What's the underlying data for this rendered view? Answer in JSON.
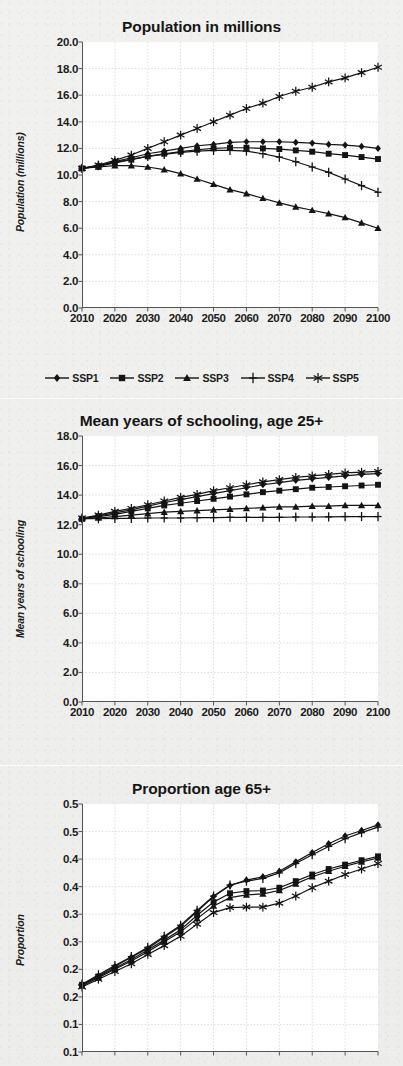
{
  "page": {
    "background_color": "#efefed",
    "plot_background_color": "#ffffff",
    "ink_color": "#141414",
    "gridline_color": "#cfcfcf"
  },
  "legend": {
    "position": "below-first-chart",
    "items": [
      {
        "label": "SSP1",
        "marker": "diamond-marker-icon"
      },
      {
        "label": "SSP2",
        "marker": "square-marker-icon"
      },
      {
        "label": "SSP3",
        "marker": "triangle-marker-icon"
      },
      {
        "label": "SSP4",
        "marker": "plus-marker-icon"
      },
      {
        "label": "SSP5",
        "marker": "asterisk-marker-icon"
      }
    ]
  },
  "chart_data": [
    {
      "id": "population",
      "type": "line",
      "title": "Population in millions",
      "xlabel": "",
      "ylabel": "Population (millions)",
      "x": [
        2010,
        2015,
        2020,
        2025,
        2030,
        2035,
        2040,
        2045,
        2050,
        2055,
        2060,
        2065,
        2070,
        2075,
        2080,
        2085,
        2090,
        2095,
        2100
      ],
      "xticks": [
        2010,
        2020,
        2030,
        2040,
        2050,
        2060,
        2070,
        2080,
        2090,
        2100
      ],
      "xtick_labels": [
        "2010",
        "2020",
        "2030",
        "2040",
        "2050",
        "2060",
        "2070",
        "2080",
        "2090",
        "2100"
      ],
      "xlim": [
        2010,
        2100
      ],
      "ylim": [
        0.0,
        20.0
      ],
      "yticks": [
        0.0,
        2.0,
        4.0,
        6.0,
        8.0,
        10.0,
        12.0,
        14.0,
        16.0,
        18.0,
        20.0
      ],
      "ytick_labels": [
        "0.0",
        "2.0",
        "4.0",
        "6.0",
        "8.0",
        "10.0",
        "12.0",
        "14.0",
        "16.0",
        "18.0",
        "20.0"
      ],
      "grid": true,
      "series": [
        {
          "name": "SSP1",
          "marker": "diamond-marker-icon",
          "values": [
            10.5,
            10.7,
            11.0,
            11.3,
            11.6,
            11.8,
            12.0,
            12.2,
            12.3,
            12.45,
            12.5,
            12.5,
            12.5,
            12.45,
            12.4,
            12.3,
            12.25,
            12.15,
            12.0
          ]
        },
        {
          "name": "SSP2",
          "marker": "square-marker-icon",
          "values": [
            10.5,
            10.65,
            10.9,
            11.15,
            11.4,
            11.6,
            11.75,
            11.9,
            12.0,
            12.05,
            12.05,
            12.0,
            11.95,
            11.85,
            11.75,
            11.6,
            11.5,
            11.35,
            11.2
          ]
        },
        {
          "name": "SSP3",
          "marker": "triangle-marker-icon",
          "values": [
            10.5,
            10.6,
            10.7,
            10.7,
            10.6,
            10.4,
            10.1,
            9.7,
            9.3,
            8.9,
            8.6,
            8.25,
            7.9,
            7.6,
            7.35,
            7.1,
            6.8,
            6.4,
            6.0
          ]
        },
        {
          "name": "SSP4",
          "marker": "plus-marker-icon",
          "values": [
            10.5,
            10.7,
            10.95,
            11.2,
            11.4,
            11.55,
            11.7,
            11.8,
            11.85,
            11.85,
            11.8,
            11.6,
            11.35,
            11.0,
            10.6,
            10.2,
            9.7,
            9.2,
            8.7
          ]
        },
        {
          "name": "SSP5",
          "marker": "asterisk-marker-icon",
          "values": [
            10.5,
            10.75,
            11.1,
            11.5,
            12.0,
            12.5,
            13.0,
            13.5,
            14.0,
            14.5,
            15.0,
            15.4,
            15.9,
            16.3,
            16.6,
            17.0,
            17.3,
            17.7,
            18.1
          ]
        }
      ]
    },
    {
      "id": "schooling",
      "type": "line",
      "title": "Mean years of schooling, age 25+",
      "xlabel": "",
      "ylabel": "Mean years of schooling",
      "x": [
        2010,
        2015,
        2020,
        2025,
        2030,
        2035,
        2040,
        2045,
        2050,
        2055,
        2060,
        2065,
        2070,
        2075,
        2080,
        2085,
        2090,
        2095,
        2100
      ],
      "xticks": [
        2010,
        2020,
        2030,
        2040,
        2050,
        2060,
        2070,
        2080,
        2090,
        2100
      ],
      "xtick_labels": [
        "2010",
        "2020",
        "2030",
        "2040",
        "2050",
        "2060",
        "2070",
        "2080",
        "2090",
        "2100"
      ],
      "xlim": [
        2010,
        2100
      ],
      "ylim": [
        0.0,
        18.0
      ],
      "yticks": [
        0.0,
        2.0,
        4.0,
        6.0,
        8.0,
        10.0,
        12.0,
        14.0,
        16.0,
        18.0
      ],
      "ytick_labels": [
        "0.0",
        "2.0",
        "4.0",
        "6.0",
        "8.0",
        "10.0",
        "12.0",
        "14.0",
        "16.0",
        "18.0"
      ],
      "grid": true,
      "series": [
        {
          "name": "SSP1",
          "marker": "diamond-marker-icon",
          "values": [
            12.4,
            12.6,
            12.8,
            13.0,
            13.25,
            13.5,
            13.7,
            13.9,
            14.1,
            14.3,
            14.5,
            14.7,
            14.85,
            15.0,
            15.1,
            15.2,
            15.3,
            15.4,
            15.45
          ]
        },
        {
          "name": "SSP2",
          "marker": "square-marker-icon",
          "values": [
            12.4,
            12.55,
            12.7,
            12.9,
            13.1,
            13.3,
            13.45,
            13.6,
            13.75,
            13.9,
            14.05,
            14.2,
            14.3,
            14.4,
            14.5,
            14.55,
            14.6,
            14.65,
            14.7
          ]
        },
        {
          "name": "SSP3",
          "marker": "triangle-marker-icon",
          "values": [
            12.4,
            12.45,
            12.55,
            12.65,
            12.75,
            12.85,
            12.9,
            12.95,
            13.0,
            13.05,
            13.1,
            13.15,
            13.2,
            13.2,
            13.25,
            13.25,
            13.3,
            13.3,
            13.3
          ]
        },
        {
          "name": "SSP4",
          "marker": "plus-marker-icon",
          "values": [
            12.4,
            12.4,
            12.42,
            12.43,
            12.45,
            12.45,
            12.45,
            12.47,
            12.48,
            12.5,
            12.5,
            12.5,
            12.5,
            12.52,
            12.52,
            12.53,
            12.55,
            12.55,
            12.55
          ]
        },
        {
          "name": "SSP5",
          "marker": "asterisk-marker-icon",
          "values": [
            12.45,
            12.65,
            12.9,
            13.1,
            13.35,
            13.6,
            13.85,
            14.05,
            14.3,
            14.5,
            14.7,
            14.9,
            15.05,
            15.2,
            15.3,
            15.4,
            15.5,
            15.55,
            15.6
          ]
        }
      ]
    },
    {
      "id": "proportion65",
      "type": "line",
      "title": "Proportion age 65+",
      "xlabel": "",
      "ylabel": "Proportion",
      "x": [
        2010,
        2015,
        2020,
        2025,
        2030,
        2035,
        2040,
        2045,
        2050,
        2055,
        2060,
        2065,
        2070,
        2075,
        2080,
        2085,
        2090,
        2095,
        2100
      ],
      "xticks": [
        2010,
        2020,
        2030,
        2040,
        2050,
        2060,
        2070,
        2080,
        2090,
        2100
      ],
      "xtick_labels": [
        "2010",
        "2020",
        "2030",
        "2040",
        "2050",
        "2060",
        "2070",
        "2080",
        "2090",
        "2100"
      ],
      "xlim": [
        2010,
        2100
      ],
      "ylim": [
        0.05,
        0.5
      ],
      "yticks": [
        0.5,
        0.45,
        0.4,
        0.35,
        0.3,
        0.25,
        0.2,
        0.15,
        0.1,
        0.05
      ],
      "ytick_labels": [
        "0.5",
        "0.5",
        "0.4",
        "0.4",
        "0.3",
        "0.3",
        "0.2",
        "0.2",
        "0.1",
        "0.1"
      ],
      "grid": true,
      "series": [
        {
          "name": "SSP1",
          "marker": "diamond-marker-icon",
          "values": [
            0.172,
            0.188,
            0.205,
            0.222,
            0.238,
            0.258,
            0.278,
            0.305,
            0.332,
            0.352,
            0.362,
            0.368,
            0.378,
            0.395,
            0.412,
            0.428,
            0.442,
            0.452,
            0.462
          ]
        },
        {
          "name": "SSP2",
          "marker": "square-marker-icon",
          "values": [
            0.172,
            0.187,
            0.202,
            0.218,
            0.235,
            0.253,
            0.272,
            0.298,
            0.322,
            0.338,
            0.342,
            0.343,
            0.348,
            0.36,
            0.372,
            0.382,
            0.39,
            0.398,
            0.405
          ]
        },
        {
          "name": "SSP3",
          "marker": "triangle-marker-icon",
          "values": [
            0.17,
            0.185,
            0.2,
            0.215,
            0.232,
            0.25,
            0.268,
            0.292,
            0.315,
            0.33,
            0.335,
            0.337,
            0.343,
            0.355,
            0.368,
            0.378,
            0.387,
            0.395,
            0.402
          ]
        },
        {
          "name": "SSP4",
          "marker": "plus-marker-icon",
          "values": [
            0.173,
            0.19,
            0.207,
            0.223,
            0.24,
            0.26,
            0.28,
            0.307,
            0.333,
            0.353,
            0.36,
            0.365,
            0.375,
            0.392,
            0.408,
            0.423,
            0.437,
            0.448,
            0.458
          ]
        },
        {
          "name": "SSP5",
          "marker": "asterisk-marker-icon",
          "values": [
            0.168,
            0.182,
            0.196,
            0.21,
            0.227,
            0.243,
            0.26,
            0.282,
            0.303,
            0.312,
            0.313,
            0.313,
            0.32,
            0.333,
            0.348,
            0.36,
            0.372,
            0.382,
            0.392
          ]
        }
      ]
    }
  ]
}
